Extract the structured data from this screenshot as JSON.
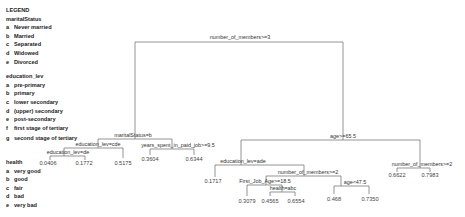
{
  "legend": {
    "title": "LEGEND",
    "groups": [
      {
        "name": "maritalStatus",
        "items": [
          {
            "key": "a",
            "label": "Never married"
          },
          {
            "key": "b",
            "label": "Married"
          },
          {
            "key": "c",
            "label": "Separated"
          },
          {
            "key": "d",
            "label": "Widowed"
          },
          {
            "key": "e",
            "label": "Divorced"
          }
        ]
      },
      {
        "name": "education_lev",
        "items": [
          {
            "key": "a",
            "label": "pre-primary"
          },
          {
            "key": "b",
            "label": "primary"
          },
          {
            "key": "c",
            "label": "lower secondary"
          },
          {
            "key": "d",
            "label": "(upper) secondary"
          },
          {
            "key": "e",
            "label": "post-secondary"
          },
          {
            "key": "f",
            "label": "first stage of tertiary"
          },
          {
            "key": "g",
            "label": "second stage of tertiary"
          }
        ]
      },
      {
        "name": "health",
        "items": [
          {
            "key": "a",
            "label": "very good"
          },
          {
            "key": "b",
            "label": "good"
          },
          {
            "key": "c",
            "label": "fair"
          },
          {
            "key": "d",
            "label": "bad"
          },
          {
            "key": "e",
            "label": "very bad"
          }
        ]
      }
    ]
  },
  "tree": {
    "splits": {
      "root": "number_of_members>=3",
      "left": "maritalStatus=b",
      "left_left": "education_lev=cde",
      "left_left_left": "education_lev=de",
      "left_right": "years_spent_in_paid_job>=9.5",
      "right": "age>=65.5",
      "right_left": "education_lev=ade",
      "right_left_right": "number_of_members>=2",
      "rlr_left": "First_Job_Age>=18.5",
      "rlr_left_right": "health=abc",
      "rlr_right": "age<47.5",
      "right_right": "number_of_members>=2"
    },
    "leaves": {
      "l1": "0.0406",
      "l2": "0.1772",
      "l3": "0.5175",
      "l4": "0.3604",
      "l5": "0.6344",
      "r1": "0.1717",
      "r2": "0.3079",
      "r3": "0.4565",
      "r4": "0.6554",
      "r5": "0.468",
      "r6": "0.7350",
      "r7": "0.6622",
      "r8": "0.7983"
    }
  }
}
